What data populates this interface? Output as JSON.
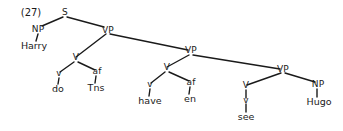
{
  "figure": {
    "example_number": "(27)",
    "type": "syntax-tree",
    "sentence": "Harry do-Tns have-en see Hugo"
  },
  "nodes": {
    "s": "S",
    "np_subject": "NP",
    "vp_top": "VP",
    "v_do": "V",
    "v_lower_do": "v",
    "af_tns": "af",
    "vp_mid": "VP",
    "v_have": "V",
    "v_lower_have": "v",
    "af_en": "af",
    "vp_low": "VP",
    "v_see": "V",
    "v_lower_see": "v",
    "np_object": "NP"
  },
  "terminals": {
    "harry": "Harry",
    "do": "do",
    "tns": "Tns",
    "have": "have",
    "en": "en",
    "see": "see",
    "hugo": "Hugo"
  },
  "colors": {
    "ink": "#1a1a1a",
    "background": "#ffffff"
  }
}
